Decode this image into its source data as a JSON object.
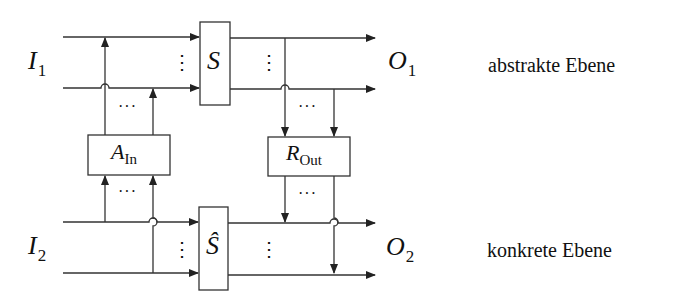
{
  "diagram": {
    "inputs": [
      {
        "symbol": "I",
        "index": "1"
      },
      {
        "symbol": "I",
        "index": "2"
      }
    ],
    "outputs": [
      {
        "symbol": "O",
        "index": "1"
      },
      {
        "symbol": "O",
        "index": "2"
      }
    ],
    "blocks": {
      "abstract_system": {
        "symbol": "S"
      },
      "concrete_system": {
        "symbol": "Ŝ"
      },
      "input_adapter": {
        "symbol": "A",
        "subscript": "In"
      },
      "output_retrieval": {
        "symbol": "R",
        "subscript": "Out"
      }
    },
    "levels": {
      "abstract": "abstrakte Ebene",
      "concrete": "konkrete Ebene"
    },
    "ellipsis_horizontal": "···",
    "ellipsis_vertical": "⋮",
    "colors": {
      "stroke": "#333333",
      "text": "#111111",
      "background": "#ffffff"
    }
  }
}
